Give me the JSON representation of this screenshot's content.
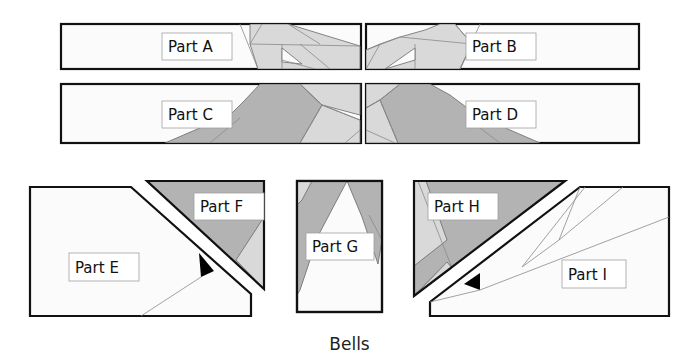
{
  "diagram": {
    "caption": "Bells",
    "parts": {
      "a": {
        "label": "Part A"
      },
      "b": {
        "label": "Part B"
      },
      "c": {
        "label": "Part C"
      },
      "d": {
        "label": "Part D"
      },
      "e": {
        "label": "Part E"
      },
      "f": {
        "label": "Part F"
      },
      "g": {
        "label": "Part G"
      },
      "h": {
        "label": "Part H"
      },
      "i": {
        "label": "Part I"
      }
    },
    "colors": {
      "panel_fill": "#fbfbfb",
      "light_shade": "#d9d9d9",
      "dark_shade": "#b3b3b3",
      "outline": "#111111"
    }
  }
}
